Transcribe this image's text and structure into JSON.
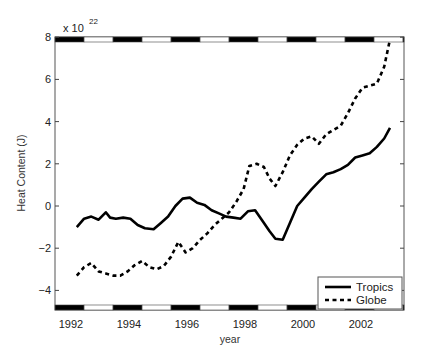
{
  "chart_data": {
    "type": "line",
    "title": "",
    "xlabel": "year",
    "ylabel": "Heat Content (J)",
    "y_multiplier_label": "x 10",
    "y_multiplier_exponent": "22",
    "xlim": [
      1991.45,
      2003.5
    ],
    "ylim": [
      -4.9,
      8
    ],
    "x_ticks": [
      1992,
      1994,
      1996,
      1998,
      2000,
      2002
    ],
    "x_tick_labels": [
      "1992",
      "1994",
      "1996",
      "1998",
      "2000",
      "2002"
    ],
    "y_ticks": [
      -4,
      -2,
      0,
      2,
      4,
      6,
      8
    ],
    "y_tick_labels": [
      "−4",
      "−2",
      "0",
      "2",
      "4",
      "6",
      "8"
    ],
    "grid": false,
    "legend_position": "lower right",
    "series": [
      {
        "name": "Tropics",
        "style": "solid",
        "color": "#000000",
        "x": [
          1992.2,
          1992.45,
          1992.7,
          1992.95,
          1993.2,
          1993.35,
          1993.55,
          1993.8,
          1994.05,
          1994.3,
          1994.55,
          1994.85,
          1995.1,
          1995.35,
          1995.6,
          1995.85,
          1996.1,
          1996.35,
          1996.6,
          1996.85,
          1997.1,
          1997.35,
          1997.6,
          1997.85,
          1998.1,
          1998.35,
          1998.6,
          1998.85,
          1999.05,
          1999.3,
          1999.55,
          1999.8,
          2000.05,
          2000.3,
          2000.55,
          2000.8,
          2001.05,
          2001.3,
          2001.55,
          2001.8,
          2002.05,
          2002.3,
          2002.55,
          2002.8,
          2003.0
        ],
        "values": [
          -1.0,
          -0.6,
          -0.5,
          -0.65,
          -0.3,
          -0.55,
          -0.6,
          -0.55,
          -0.6,
          -0.9,
          -1.05,
          -1.1,
          -0.8,
          -0.5,
          0.0,
          0.35,
          0.4,
          0.15,
          0.05,
          -0.2,
          -0.35,
          -0.5,
          -0.55,
          -0.6,
          -0.25,
          -0.2,
          -0.7,
          -1.2,
          -1.55,
          -1.6,
          -0.8,
          0.0,
          0.4,
          0.8,
          1.15,
          1.5,
          1.6,
          1.75,
          1.95,
          2.3,
          2.4,
          2.5,
          2.8,
          3.2,
          3.7
        ]
      },
      {
        "name": "Globe",
        "style": "dashed",
        "color": "#000000",
        "x": [
          1992.2,
          1992.45,
          1992.7,
          1992.95,
          1993.2,
          1993.45,
          1993.7,
          1993.95,
          1994.2,
          1994.45,
          1994.7,
          1994.95,
          1995.2,
          1995.45,
          1995.7,
          1995.95,
          1996.2,
          1996.45,
          1996.7,
          1996.95,
          1997.2,
          1997.45,
          1997.7,
          1997.95,
          1998.15,
          1998.4,
          1998.65,
          1998.85,
          1999.05,
          1999.3,
          1999.55,
          1999.8,
          2000.05,
          2000.3,
          2000.55,
          2000.8,
          2001.05,
          2001.3,
          2001.55,
          2001.8,
          2002.05,
          2002.3,
          2002.55,
          2002.8,
          2003.0
        ],
        "values": [
          -3.3,
          -2.9,
          -2.7,
          -3.1,
          -3.2,
          -3.3,
          -3.3,
          -3.1,
          -2.8,
          -2.6,
          -2.9,
          -3.0,
          -2.85,
          -2.4,
          -1.7,
          -2.2,
          -2.0,
          -1.6,
          -1.3,
          -0.9,
          -0.6,
          -0.3,
          0.2,
          0.8,
          1.9,
          2.0,
          1.85,
          1.3,
          0.95,
          1.6,
          2.4,
          2.9,
          3.2,
          3.3,
          2.95,
          3.4,
          3.6,
          3.8,
          4.4,
          5.1,
          5.6,
          5.7,
          5.8,
          6.6,
          7.9
        ]
      }
    ]
  }
}
